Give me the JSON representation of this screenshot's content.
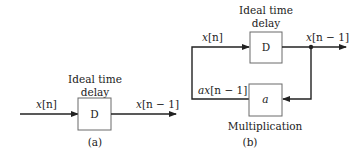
{
  "panel_a": {
    "block_label": "D",
    "title_line1": "Ideal time",
    "title_line2": "delay",
    "input_label_var": "x",
    "input_label_idx": "[n]",
    "output_label_var": "x",
    "output_label_idx": "[n − 1]",
    "caption": "(a)"
  },
  "panel_b": {
    "delay_block_label": "D",
    "title_line1": "Ideal time",
    "title_line2": "delay",
    "input_label_var": "x",
    "input_label_idx": "[n]",
    "output_label_var": "x",
    "output_label_idx": "[n − 1]",
    "feedback_label_var": "ax",
    "feedback_label_idx": "[n − 1]",
    "multiplier_block_label": "a",
    "multiplier_caption": "Multiplication",
    "caption": "(b)"
  },
  "colors": {
    "line": "#222222",
    "box_border": "#6a6a6a",
    "background": "#ffffff"
  }
}
